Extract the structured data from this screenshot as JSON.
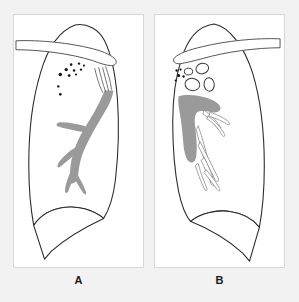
{
  "figure": {
    "background_color": "#f2f2f2",
    "panel_background": "#ffffff",
    "outline_color": "#2b2b2b",
    "vessel_color": "#9a9a9a",
    "nodule_color": "#141414",
    "cavity_stroke": "#3a3a3a"
  },
  "panels": [
    {
      "id": "a",
      "label": "A",
      "lung": {
        "name": "lung-outline",
        "path": "M 62 10 C 74 8 86 14 92 26 C 99 40 103 60 105 84 C 107 112 106 140 103 166 C 101 182 97 196 91 205 C 80 196 64 192 50 194 C 36 196 26 203 20 212 C 17 196 15 174 15 150 C 15 118 19 84 27 58 C 34 34 46 16 62 10 Z"
      },
      "lung_base": {
        "name": "costophrenic-angle",
        "path": "M 20 212 C 26 203 36 196 50 194 C 64 192 80 196 91 205 L 91 205 C 76 212 56 222 38 238 L 31 246 Z"
      },
      "clavicle": {
        "name": "clavicle-bar",
        "path": "M 2 26 C 26 25 56 28 80 34 C 92 37 100 41 103 45 C 105 48 103 51 99 51 C 94 51 88 49 80 46 C 58 39 26 35 2 35 Z"
      },
      "vessel_tree": {
        "name": "pulmonary-vessel-tree",
        "trunk": "M 92 76 C 88 86 82 98 74 110 C 68 119 63 129 60 140 C 57 150 56 160 58 170 C 61 170 64 168 65 163 C 66 152 68 142 73 132 C 79 120 86 108 92 98 C 97 90 100 83 101 76 Z",
        "branches": [
          "M 72 112 C 65 110 56 108 48 108 C 44 108 42 110 44 112 C 48 114 56 115 64 117 C 68 118 71 118 73 117 Z",
          "M 66 132 C 60 134 52 140 46 148 C 43 152 44 155 47 153 C 52 149 58 143 65 139 C 68 137 69 134 67 132 Z",
          "M 62 150 C 58 156 54 165 52 174 C 51 179 53 181 55 178 C 58 170 61 162 65 156 Z",
          "M 59 160 C 62 166 66 173 70 179 C 72 182 74 181 73 178 C 70 170 66 163 62 157 Z"
        ]
      },
      "nodules": [
        {
          "cx": 75,
          "cy": 42,
          "r": 1.1
        },
        {
          "cx": 58,
          "cy": 50,
          "r": 1.3
        },
        {
          "cx": 66,
          "cy": 49,
          "r": 1.2
        },
        {
          "cx": 71,
          "cy": 51,
          "r": 1.1
        },
        {
          "cx": 53,
          "cy": 55,
          "r": 1.7
        },
        {
          "cx": 61,
          "cy": 56,
          "r": 1.3
        },
        {
          "cx": 68,
          "cy": 55,
          "r": 1.2
        },
        {
          "cx": 47,
          "cy": 60,
          "r": 1.8
        },
        {
          "cx": 56,
          "cy": 61,
          "r": 1.4
        },
        {
          "cx": 63,
          "cy": 60,
          "r": 1.1
        },
        {
          "cx": 45,
          "cy": 72,
          "r": 1.2
        },
        {
          "cx": 47,
          "cy": 80,
          "r": 1.3
        }
      ],
      "hairlines": [
        "M 82 54 C 84 62 86 70 90 78",
        "M 86 53 C 88 61 90 69 93 77",
        "M 90 53 C 92 61 94 68 96 76",
        "M 93 52 C 96 60 98 67 99 75"
      ]
    },
    {
      "id": "b",
      "label": "B",
      "lung": {
        "name": "lung-outline",
        "path": "M 60 9 C 44 11 33 24 27 44 C 21 62 18 84 18 108 C 18 134 20 158 24 178 C 27 192 31 202 36 208 C 46 200 62 196 76 198 C 90 200 100 206 106 214 C 109 198 111 176 111 152 C 111 118 107 84 99 58 C 91 33 76 12 60 9 Z"
      },
      "lung_base": {
        "name": "costophrenic-angle",
        "path": "M 106 214 C 100 206 90 200 76 198 C 62 196 46 200 36 208 L 36 208 C 51 214 71 224 89 240 L 96 248 Z"
      },
      "clavicle": {
        "name": "clavicle-bar",
        "path": "M 127 24 C 104 23 72 26 48 32 C 34 35 24 39 20 43 C 17 46 20 50 26 49 C 33 48 40 46 48 44 C 72 37 104 33 127 33 Z"
      },
      "vessel_mass": {
        "name": "retracted-hilar-mass",
        "path": "M 24 82 C 30 80 40 80 50 83 C 58 85 64 88 66 92 C 68 96 64 99 58 98 C 52 97 47 96 43 98 C 40 100 40 106 41 114 C 42 124 43 134 42 142 C 41 148 38 150 35 148 C 32 146 30 140 29 132 C 28 120 27 108 25 98 C 24 92 23 86 24 82 Z"
      },
      "cavities": [
        {
          "name": "cavity-upper-right",
          "cx": 48,
          "cy": 54,
          "rx": 6.5,
          "ry": 5.2,
          "rot": -15
        },
        {
          "name": "cavity-upper-left",
          "cx": 34,
          "cy": 57,
          "rx": 4.2,
          "ry": 3.4,
          "rot": 0
        },
        {
          "name": "cavity-lower-left",
          "cx": 38,
          "cy": 70,
          "rx": 7.5,
          "ry": 6.2,
          "rot": 10
        },
        {
          "name": "cavity-lower-right",
          "cx": 55,
          "cy": 70,
          "rx": 5.2,
          "ry": 6.8,
          "rot": -5
        }
      ],
      "nodules": [
        {
          "cx": 22,
          "cy": 56,
          "r": 1.2
        },
        {
          "cx": 26,
          "cy": 55,
          "r": 1.1
        },
        {
          "cx": 24,
          "cy": 61,
          "r": 1.6
        },
        {
          "cx": 29,
          "cy": 62,
          "r": 1.2
        },
        {
          "cx": 21,
          "cy": 66,
          "r": 1.1
        }
      ],
      "strands": [
        "M 50 96 C 56 100 62 106 66 112 C 68 115 66 117 64 115 C 60 110 55 104 49 100 Z",
        "M 56 98 C 62 100 69 103 74 107 C 77 109 76 112 73 110 C 68 107 62 104 55 102 Z",
        "M 54 102 C 60 106 66 112 70 119 C 72 122 70 124 68 121 C 64 114 59 108 53 105 Z",
        "M 44 112 C 48 124 52 138 55 150 C 57 157 56 160 53 156 C 49 144 45 128 42 116 Z",
        "M 46 128 C 52 140 58 152 63 162 C 66 167 64 170 61 166 C 56 156 50 144 44 132 Z",
        "M 50 144 C 54 152 58 160 60 168 C 61 172 59 174 57 170 C 54 162 50 153 47 147 Z",
        "M 44 150 C 46 158 49 166 52 173 C 54 177 52 179 50 175 C 46 167 43 158 41 152 Z",
        "M 52 156 C 57 162 62 168 65 174 C 67 177 65 179 63 176 C 59 170 54 164 50 159 Z"
      ]
    }
  ]
}
